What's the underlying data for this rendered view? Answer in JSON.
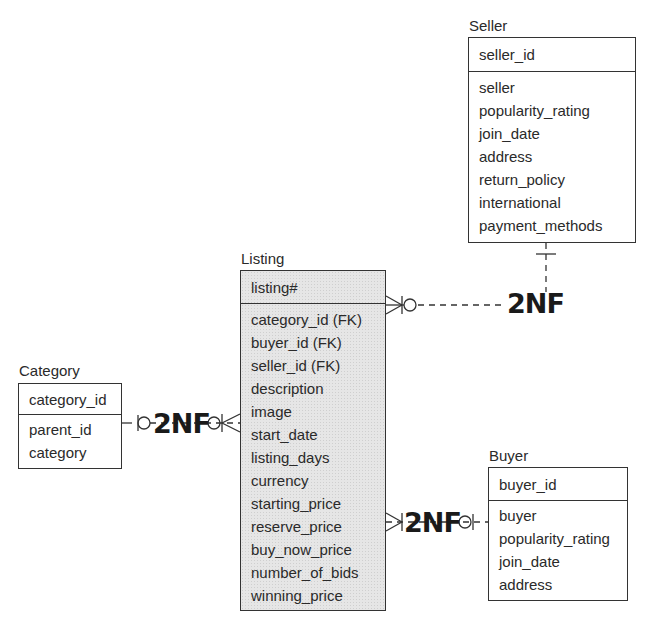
{
  "entities": {
    "seller": {
      "title": "Seller",
      "pk": "seller_id",
      "attributes": [
        "seller",
        "popularity_rating",
        "join_date",
        "address",
        "return_policy",
        "international",
        "payment_methods"
      ]
    },
    "listing": {
      "title": "Listing",
      "pk": "listing#",
      "attributes": [
        "category_id (FK)",
        "buyer_id (FK)",
        "seller_id (FK)",
        "description",
        "image",
        "start_date",
        "listing_days",
        "currency",
        "starting_price",
        "reserve_price",
        "buy_now_price",
        "number_of_bids",
        "winning_price"
      ]
    },
    "category": {
      "title": "Category",
      "pk": "category_id",
      "attributes": [
        "parent_id",
        "category"
      ]
    },
    "buyer": {
      "title": "Buyer",
      "pk": "buyer_id",
      "attributes": [
        "buyer",
        "popularity_rating",
        "join_date",
        "address"
      ]
    }
  },
  "relationships": [
    {
      "from": "Listing",
      "to": "Seller",
      "label": "2NF",
      "from_cardinality": "zero-or-many",
      "to_cardinality": "one"
    },
    {
      "from": "Listing",
      "to": "Category",
      "label": "2NF",
      "from_cardinality": "zero-or-many",
      "to_cardinality": "zero-or-one"
    },
    {
      "from": "Listing",
      "to": "Buyer",
      "label": "2NF",
      "from_cardinality": "one-or-many",
      "to_cardinality": "zero-or-one"
    }
  ],
  "colors": {
    "line": "#333333",
    "listing_fill": "#e6e6e6",
    "text": "#2a2a2a"
  }
}
